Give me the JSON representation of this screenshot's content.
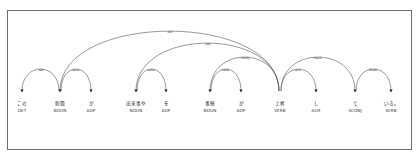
{
  "diagram": {
    "type": "dependency-parse",
    "tokens": [
      {
        "text": "この",
        "pos": "DET",
        "x": 22
      },
      {
        "text": "新聞",
        "pos": "NOUN",
        "x": 60
      },
      {
        "text": "が",
        "pos": "ADP",
        "x": 91
      },
      {
        "text": "出来事や",
        "pos": "NOUN",
        "x": 136
      },
      {
        "text": "を",
        "pos": "ADP",
        "x": 166
      },
      {
        "text": "事態",
        "pos": "NOUN",
        "x": 210
      },
      {
        "text": "が",
        "pos": "ADP",
        "x": 241
      },
      {
        "text": "上昇",
        "pos": "VERB",
        "x": 280
      },
      {
        "text": "し",
        "pos": "AUX",
        "x": 316
      },
      {
        "text": "て",
        "pos": "SCONJ",
        "x": 355
      },
      {
        "text": "いる。",
        "pos": "VERB",
        "x": 391
      }
    ],
    "arcs": [
      {
        "from": 1,
        "to": 0,
        "label": "det"
      },
      {
        "from": 1,
        "to": 2,
        "label": "case"
      },
      {
        "from": 7,
        "to": 1,
        "label": "obl"
      },
      {
        "from": 3,
        "to": 4,
        "label": "case"
      },
      {
        "from": 7,
        "to": 3,
        "label": "obj"
      },
      {
        "from": 5,
        "to": 6,
        "label": "case"
      },
      {
        "from": 7,
        "to": 5,
        "label": "nsubj"
      },
      {
        "from": 7,
        "to": 8,
        "label": "aux"
      },
      {
        "from": 7,
        "to": 9,
        "label": "mark"
      },
      {
        "from": 9,
        "to": 10,
        "label": "fixed"
      }
    ]
  }
}
